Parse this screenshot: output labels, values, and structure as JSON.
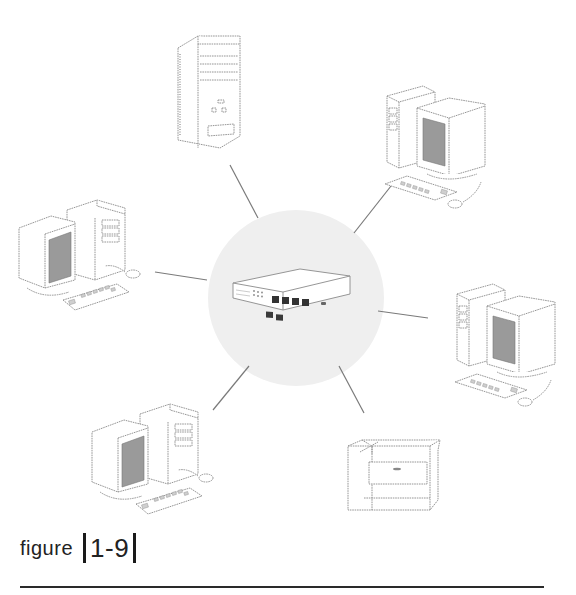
{
  "figure": {
    "caption_word": "figure",
    "caption_number": "1-9",
    "topology": "star",
    "hub": {
      "label": "switch",
      "ports": 4
    }
  },
  "colors": {
    "hub_backdrop": "#efefef",
    "line": "#7a7a7a",
    "caption_text": "#222222",
    "rule": "#2a2a2a"
  },
  "nodes": [
    {
      "id": "server-tower",
      "type": "tower",
      "position": "top"
    },
    {
      "id": "workstation-top-right",
      "type": "workstation",
      "position": "top-right"
    },
    {
      "id": "workstation-left",
      "type": "workstation",
      "position": "left"
    },
    {
      "id": "workstation-right",
      "type": "workstation",
      "position": "right"
    },
    {
      "id": "workstation-bottom-left",
      "type": "workstation",
      "position": "bottom-left"
    },
    {
      "id": "printer",
      "type": "printer",
      "position": "bottom-right"
    }
  ]
}
